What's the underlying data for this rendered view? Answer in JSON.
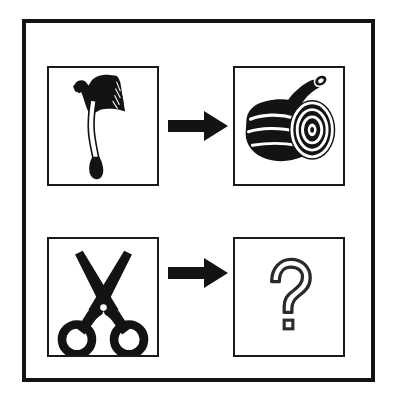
{
  "figure": {
    "type": "visual-analogy-puzzle",
    "background_color": "#ffffff",
    "ink_color": "#131313",
    "outer_frame": {
      "name": "outer-frame",
      "border_color": "#131313",
      "border_width_px": 4
    },
    "panel_border_color": "#1a1a1a",
    "arrow_color": "#131313"
  },
  "rows": [
    {
      "id": "row-1",
      "left_panel": {
        "icon": "axe-icon",
        "label": "Axe",
        "description": "Black axe with flared blade head and curved handle",
        "fill": "#131313"
      },
      "arrow": {
        "icon": "arrow-right-icon",
        "label": "leads to",
        "direction": "right",
        "fill": "#131313"
      },
      "right_panel": {
        "icon": "log-icon",
        "label": "Log",
        "description": "Cut wooden log showing concentric tree rings",
        "fill": "#131313"
      }
    },
    {
      "id": "row-2",
      "left_panel": {
        "icon": "scissors-icon",
        "label": "Scissors",
        "description": "Open scissors with ring handles and crossed blades",
        "fill": "#131313"
      },
      "arrow": {
        "icon": "arrow-right-icon",
        "label": "leads to",
        "direction": "right",
        "fill": "#131313"
      },
      "right_panel": {
        "icon": "question-mark-icon",
        "label": "?",
        "description": "Outlined question mark indicating unknown answer",
        "fill": "none",
        "stroke": "#2a2a2a"
      }
    }
  ]
}
